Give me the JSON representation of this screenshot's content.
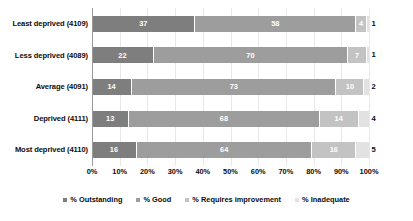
{
  "chart_data": {
    "type": "bar",
    "subtype": "stacked-horizontal-100pct",
    "title": "",
    "xlabel": "",
    "ylabel": "",
    "xlim": [
      0,
      100
    ],
    "grid": true,
    "legend_position": "bottom",
    "categories": [
      "Least deprived (4109)",
      "Less deprived (4089)",
      "Average (4091)",
      "Deprived (4111)",
      "Most deprived (4110)"
    ],
    "series": [
      {
        "name": "% Outstanding",
        "color": "#7e7e7e",
        "values": [
          37,
          22,
          14,
          13,
          16
        ]
      },
      {
        "name": "% Good",
        "color": "#9d9d9d",
        "values": [
          58,
          70,
          73,
          68,
          64
        ]
      },
      {
        "name": "% Requires improvement",
        "color": "#c3c3c3",
        "values": [
          4,
          7,
          10,
          14,
          16
        ]
      },
      {
        "name": "% Inadequate",
        "color": "#e2e2e2",
        "values": [
          1,
          1,
          2,
          4,
          5
        ]
      }
    ],
    "xticks": [
      "0%",
      "10%",
      "20%",
      "30%",
      "40%",
      "50%",
      "60%",
      "70%",
      "80%",
      "90%",
      "100%"
    ]
  }
}
